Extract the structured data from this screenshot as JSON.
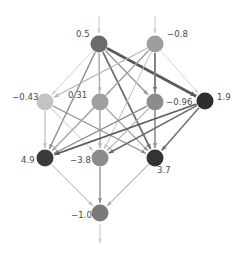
{
  "diagram": {
    "background_color": "#ffffff",
    "label_color": "#4a4a4a",
    "nodes": [
      {
        "id": "n1",
        "label": "0.5",
        "value": 0.5,
        "x": 99,
        "y": 44,
        "r": 8.5,
        "color": "#6b6b6b",
        "label_dx": -23,
        "label_dy": -10,
        "layer": "input"
      },
      {
        "id": "n2",
        "label": "−0.8",
        "value": -0.8,
        "x": 155,
        "y": 44,
        "r": 8.5,
        "color": "#9d9d9d",
        "label_dx": 12,
        "label_dy": -10,
        "layer": "input"
      },
      {
        "id": "n3",
        "label": "−0.43",
        "value": -0.43,
        "x": 45,
        "y": 102,
        "r": 8.5,
        "color": "#c3c3c3",
        "label_dx": -33,
        "label_dy": -5,
        "layer": "hidden"
      },
      {
        "id": "n4",
        "label": "0.31",
        "value": 0.31,
        "x": 100,
        "y": 102,
        "r": 8.5,
        "color": "#a0a0a0",
        "label_dx": -32,
        "label_dy": -7,
        "layer": "hidden"
      },
      {
        "id": "n5",
        "label": "−0.96",
        "value": -0.96,
        "x": 155,
        "y": 102,
        "r": 8.5,
        "color": "#8c8c8c",
        "label_dx": 11,
        "label_dy": 0,
        "layer": "hidden"
      },
      {
        "id": "n6",
        "label": "1.9",
        "value": 1.9,
        "x": 205,
        "y": 101,
        "r": 8.5,
        "color": "#2e2e2e",
        "label_dx": 12,
        "label_dy": -4,
        "layer": "hidden"
      },
      {
        "id": "n7",
        "label": "4.9",
        "value": 4.9,
        "x": 45,
        "y": 158,
        "r": 8.5,
        "color": "#3a3a3a",
        "label_dx": -24,
        "label_dy": 2,
        "layer": "hidden"
      },
      {
        "id": "n8",
        "label": "−3.8",
        "value": -3.8,
        "x": 100,
        "y": 158,
        "r": 8.5,
        "color": "#8c8c8c",
        "label_dx": -30,
        "label_dy": 2,
        "layer": "hidden"
      },
      {
        "id": "n9",
        "label": "3.7",
        "value": 3.7,
        "x": 155,
        "y": 158,
        "r": 8.5,
        "color": "#333333",
        "label_dx": 2,
        "label_dy": 12,
        "layer": "hidden"
      },
      {
        "id": "n10",
        "label": "−1.0",
        "value": -1.0,
        "x": 100,
        "y": 213,
        "r": 8.5,
        "color": "#7a7a7a",
        "label_dx": -29,
        "label_dy": 2,
        "layer": "output"
      }
    ],
    "external_arrows": [
      {
        "id": "in1",
        "type": "incoming",
        "x1": 99,
        "y1": 16,
        "x2": 99,
        "y2": 33,
        "color": "#cccccc",
        "width": 1.1
      },
      {
        "id": "in2",
        "type": "incoming",
        "x1": 155,
        "y1": 16,
        "x2": 155,
        "y2": 33,
        "color": "#cccccc",
        "width": 1.1
      },
      {
        "id": "out1",
        "type": "outgoing",
        "x1": 100,
        "y1": 224,
        "x2": 100,
        "y2": 243,
        "color": "#cccccc",
        "width": 1.1
      }
    ],
    "edges": [
      {
        "from": "n1",
        "to": "n3",
        "color": "#d2d2d2",
        "width": 1.0
      },
      {
        "from": "n1",
        "to": "n4",
        "color": "#c6c6c6",
        "width": 1.3
      },
      {
        "from": "n1",
        "to": "n5",
        "color": "#9a9a9a",
        "width": 1.5
      },
      {
        "from": "n1",
        "to": "n6",
        "color": "#5a5a5a",
        "width": 2.6
      },
      {
        "from": "n1",
        "to": "n7",
        "color": "#8f8f8f",
        "width": 1.4
      },
      {
        "from": "n1",
        "to": "n8",
        "color": "#aaaaaa",
        "width": 1.2
      },
      {
        "from": "n1",
        "to": "n9",
        "color": "#6e6e6e",
        "width": 1.8
      },
      {
        "from": "n2",
        "to": "n3",
        "color": "#b4b4b4",
        "width": 1.2
      },
      {
        "from": "n2",
        "to": "n4",
        "color": "#cfcfcf",
        "width": 1.0
      },
      {
        "from": "n2",
        "to": "n5",
        "color": "#6a6a6a",
        "width": 1.8
      },
      {
        "from": "n2",
        "to": "n6",
        "color": "#d6d6d6",
        "width": 1.0
      },
      {
        "from": "n2",
        "to": "n7",
        "color": "#9f9f9f",
        "width": 1.2
      },
      {
        "from": "n2",
        "to": "n8",
        "color": "#c0c0c0",
        "width": 1.0
      },
      {
        "from": "n2",
        "to": "n9",
        "color": "#8a8a8a",
        "width": 1.3
      },
      {
        "from": "n3",
        "to": "n7",
        "color": "#c0c0c0",
        "width": 1.3
      },
      {
        "from": "n3",
        "to": "n8",
        "color": "#c8c8c8",
        "width": 1.0
      },
      {
        "from": "n3",
        "to": "n9",
        "color": "#8d8d8d",
        "width": 1.2
      },
      {
        "from": "n4",
        "to": "n7",
        "color": "#b0b0b0",
        "width": 1.2
      },
      {
        "from": "n4",
        "to": "n8",
        "color": "#b8b8b8",
        "width": 1.4
      },
      {
        "from": "n4",
        "to": "n9",
        "color": "#9a9a9a",
        "width": 1.2
      },
      {
        "from": "n5",
        "to": "n7",
        "color": "#8a8a8a",
        "width": 1.3
      },
      {
        "from": "n5",
        "to": "n8",
        "color": "#b5b5b5",
        "width": 1.2
      },
      {
        "from": "n5",
        "to": "n9",
        "color": "#9d9d9d",
        "width": 1.4
      },
      {
        "from": "n6",
        "to": "n7",
        "color": "#5f5f5f",
        "width": 1.7
      },
      {
        "from": "n6",
        "to": "n8",
        "color": "#6a6a6a",
        "width": 1.5
      },
      {
        "from": "n6",
        "to": "n9",
        "color": "#6f6f6f",
        "width": 1.5
      },
      {
        "from": "n7",
        "to": "n10",
        "color": "#c2c2c2",
        "width": 1.1
      },
      {
        "from": "n8",
        "to": "n10",
        "color": "#8a8a8a",
        "width": 1.3
      },
      {
        "from": "n9",
        "to": "n10",
        "color": "#b0b0b0",
        "width": 1.1
      }
    ]
  }
}
